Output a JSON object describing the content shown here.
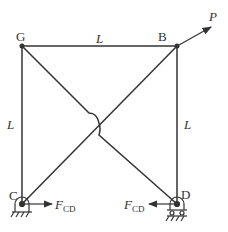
{
  "diagram": {
    "type": "truss",
    "nodes": {
      "G": {
        "label": "G",
        "x": 22,
        "y": 46
      },
      "B": {
        "label": "B",
        "x": 177,
        "y": 46
      },
      "C": {
        "label": "C",
        "x": 22,
        "y": 204
      },
      "D": {
        "label": "D",
        "x": 177,
        "y": 204
      }
    },
    "members": [
      {
        "from": "G",
        "to": "B"
      },
      {
        "from": "G",
        "to": "C"
      },
      {
        "from": "B",
        "to": "D"
      },
      {
        "from": "G",
        "to": "D"
      },
      {
        "from": "C",
        "to": "B"
      }
    ],
    "dimension_labels": {
      "top": "L",
      "left": "L",
      "right": "L"
    },
    "load": {
      "label": "P",
      "at": "B"
    },
    "forces": {
      "C": {
        "label": "F",
        "subscript": "CD",
        "direction": "right"
      },
      "D": {
        "label": "F",
        "subscript": "CD",
        "direction": "left"
      }
    },
    "supports": {
      "C": "pin",
      "D": "roller"
    }
  }
}
